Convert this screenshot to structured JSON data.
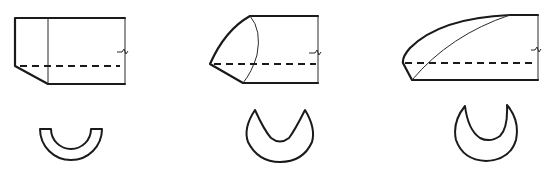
{
  "diagram": {
    "stroke_color": "#1a1a1a",
    "background": "#ffffff",
    "figures": [
      {
        "id": "square-cut",
        "profile": "flat chamfered end",
        "section": "half-ring (U shape)"
      },
      {
        "id": "short-bevel",
        "profile": "short curved bevel point",
        "section": "crescent"
      },
      {
        "id": "long-bevel",
        "profile": "long tapered curved bevel",
        "section": "deep crescent"
      }
    ]
  }
}
